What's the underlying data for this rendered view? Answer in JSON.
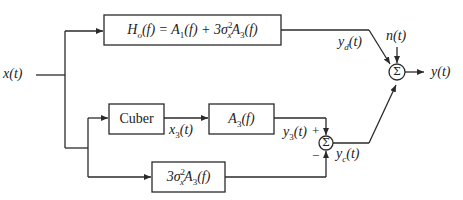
{
  "diagram": {
    "type": "block-diagram",
    "input": {
      "label": "x(t)"
    },
    "output": {
      "label": "y(t)"
    },
    "noise": {
      "label": "n(t)"
    },
    "blocks": [
      {
        "id": "Ho",
        "text_main": "H",
        "text_sub": "o",
        "text_rest": "(f) = A",
        "a1_sub": "1",
        "mid": "(f) + 3σ",
        "sig_sub": "x",
        "sig_sup": "2",
        "a": "A",
        "a3_sub": "3",
        "end": "(f)"
      },
      {
        "id": "cuber",
        "label": "Cuber"
      },
      {
        "id": "A3",
        "text": "A",
        "sub": "3",
        "end": "(f)"
      },
      {
        "id": "sigmaA3",
        "pre": "3σ",
        "sig_sub": "x",
        "sig_sup": "2",
        "a": "A",
        "a3_sub": "3",
        "end": "(f)"
      }
    ],
    "signals": {
      "x3": {
        "base": "x",
        "sub": "3",
        "end": "(t)"
      },
      "y3": {
        "base": "y",
        "sub": "3",
        "end": "(t)"
      },
      "yd": {
        "base": "y",
        "sub": "d",
        "end": "(t)"
      },
      "yc": {
        "base": "y",
        "sub": "c",
        "end": "(t)"
      }
    },
    "summers": [
      {
        "id": "sum-inner",
        "glyph": "Σ",
        "plus": "+",
        "minus": "−"
      },
      {
        "id": "sum-output",
        "glyph": "Σ"
      }
    ]
  }
}
